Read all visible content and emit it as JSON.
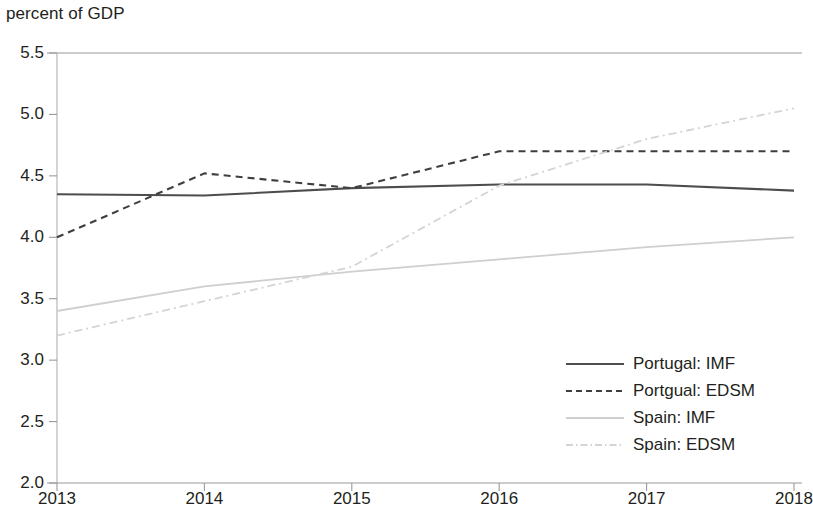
{
  "chart_data": {
    "type": "line",
    "title": "",
    "ylabel": "percent of GDP",
    "xlabel": "",
    "x": [
      2013,
      2014,
      2015,
      2016,
      2017,
      2018
    ],
    "categories": [
      "2013",
      "2014",
      "2015",
      "2016",
      "2017",
      "2018"
    ],
    "ylim": [
      2.0,
      5.5
    ],
    "xlim": [
      2013,
      2018
    ],
    "ytick_labels": [
      "5.5",
      "5.0",
      "4.5",
      "4.0",
      "3.5",
      "3.0",
      "2.5",
      "2.0"
    ],
    "ytick_values": [
      5.5,
      5.0,
      4.5,
      4.0,
      3.5,
      3.0,
      2.5,
      2.0
    ],
    "grid": false,
    "legend_position": "bottom-right",
    "series": [
      {
        "name": "Portugal: IMF",
        "style": "solid",
        "color": "#4d4d4d",
        "values": [
          4.35,
          4.34,
          4.4,
          4.43,
          4.43,
          4.38
        ]
      },
      {
        "name": "Portgual: EDSM",
        "style": "dashed",
        "color": "#3f3f3f",
        "values": [
          4.0,
          4.52,
          4.4,
          4.7,
          4.7,
          4.7
        ]
      },
      {
        "name": "Spain: IMF",
        "style": "solid",
        "color": "#cfcfcf",
        "values": [
          3.4,
          3.6,
          3.72,
          3.82,
          3.92,
          4.0
        ]
      },
      {
        "name": "Spain: EDSM",
        "style": "dash-dot",
        "color": "#d4d4d4",
        "values": [
          3.2,
          3.48,
          3.76,
          4.42,
          4.8,
          5.05
        ]
      }
    ]
  },
  "legend": {
    "items": [
      {
        "label": "Portugal: IMF"
      },
      {
        "label": "Portgual: EDSM"
      },
      {
        "label": "Spain: IMF"
      },
      {
        "label": "Spain: EDSM"
      }
    ]
  }
}
